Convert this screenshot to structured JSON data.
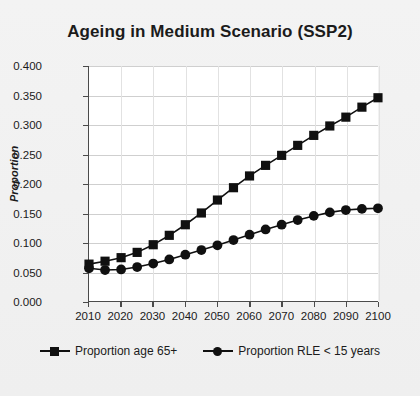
{
  "chart_data": {
    "type": "line",
    "title": "Ageing in Medium Scenario (SSP2)",
    "xlabel": "",
    "ylabel": "Proportion",
    "xlim": [
      2010,
      2100
    ],
    "ylim": [
      0.0,
      0.4
    ],
    "yticks": [
      "0.000",
      "0.050",
      "0.100",
      "0.150",
      "0.200",
      "0.250",
      "0.300",
      "0.350",
      "0.400"
    ],
    "ytick_values": [
      0.0,
      0.05,
      0.1,
      0.15,
      0.2,
      0.25,
      0.3,
      0.35,
      0.4
    ],
    "xticks": [
      "2010",
      "2020",
      "2030",
      "2040",
      "2050",
      "2060",
      "2070",
      "2080",
      "2090",
      "2100"
    ],
    "xtick_values": [
      2010,
      2020,
      2030,
      2040,
      2050,
      2060,
      2070,
      2080,
      2090,
      2100
    ],
    "x": [
      2010,
      2015,
      2020,
      2025,
      2030,
      2035,
      2040,
      2045,
      2050,
      2055,
      2060,
      2065,
      2070,
      2075,
      2080,
      2085,
      2090,
      2095,
      2100
    ],
    "grid": true,
    "legend_position": "bottom",
    "series": [
      {
        "name": "Proportion age 65+",
        "marker": "square",
        "color": "#101010",
        "values": [
          0.063,
          0.068,
          0.074,
          0.083,
          0.096,
          0.112,
          0.13,
          0.15,
          0.172,
          0.193,
          0.213,
          0.231,
          0.248,
          0.265,
          0.282,
          0.298,
          0.313,
          0.33,
          0.346
        ]
      },
      {
        "name": "Proportion RLE < 15 years",
        "marker": "circle",
        "color": "#101010",
        "values": [
          0.056,
          0.053,
          0.054,
          0.058,
          0.064,
          0.071,
          0.079,
          0.087,
          0.095,
          0.104,
          0.113,
          0.122,
          0.13,
          0.138,
          0.145,
          0.151,
          0.155,
          0.157,
          0.158
        ]
      }
    ]
  },
  "legend": {
    "items": [
      {
        "label": "Proportion age 65+",
        "marker": "square"
      },
      {
        "label": "Proportion RLE < 15 years",
        "marker": "circle"
      }
    ]
  }
}
